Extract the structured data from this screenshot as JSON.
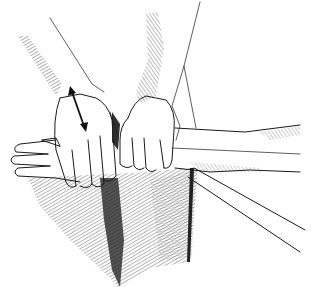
{
  "figure": {
    "type": "pen-and-ink illustration",
    "annotations": [
      {
        "kind": "double-headed-arrow",
        "meaning": "direction of motion (up/down)"
      }
    ],
    "colors": {
      "ink": "#1a1a1a",
      "paper": "#ffffff",
      "hatch": "#333333"
    }
  }
}
